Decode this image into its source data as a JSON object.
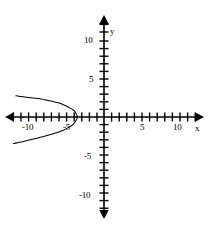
{
  "figure": {
    "name": "cartesian-plane-with-leftward-parabola",
    "background_color": "#ffffff",
    "stroke_color": "#000000"
  },
  "axes": {
    "x_axis_label": "x",
    "y_axis_label": "y",
    "x_tick_labels": [
      "-10",
      "-5",
      "5",
      "10"
    ],
    "y_tick_labels": [
      "10",
      "5",
      "-5",
      "-10"
    ],
    "labels": {
      "x_neg10": "-10",
      "x_neg5": "-5",
      "x_5": "5",
      "x_10": "10",
      "y_10": "10",
      "y_5": "5",
      "y_neg5": "-5",
      "y_neg10": "-10"
    }
  },
  "chart_data": {
    "type": "line",
    "title": "",
    "xlabel": "x",
    "ylabel": "y",
    "xlim": [
      -12.7,
      12.7
    ],
    "ylim": [
      -13.8,
      13.8
    ],
    "grid": false,
    "legend": null,
    "x_ticks": [
      -12,
      -11,
      -10,
      -9,
      -8,
      -7,
      -6,
      -5,
      -4,
      -3,
      -2,
      -1,
      1,
      2,
      3,
      4,
      5,
      6,
      7,
      8,
      9,
      10,
      11,
      12
    ],
    "y_ticks": [
      -13,
      -12,
      -11,
      -10,
      -9,
      -8,
      -7,
      -6,
      -5,
      -4,
      -3,
      -2,
      -1,
      1,
      2,
      3,
      4,
      5,
      6,
      7,
      8,
      9,
      10,
      11,
      12,
      13
    ],
    "x_labeled_ticks": [
      -10,
      -5,
      5,
      10
    ],
    "y_labeled_ticks": [
      -10,
      -5,
      5,
      10
    ],
    "series": [
      {
        "name": "leftward-opening-parabola",
        "vertex": [
          -3.5,
          0
        ],
        "opens": "left",
        "series_points": [
          [
            -11.6,
            2.8
          ],
          [
            -11.0,
            2.7
          ],
          [
            -10.2,
            2.6
          ],
          [
            -9.3,
            2.5
          ],
          [
            -8.4,
            2.4
          ],
          [
            -7.5,
            2.2
          ],
          [
            -6.6,
            2.0
          ],
          [
            -5.8,
            1.8
          ],
          [
            -5.1,
            1.5
          ],
          [
            -4.5,
            1.2
          ],
          [
            -4.0,
            0.9
          ],
          [
            -3.7,
            0.5
          ],
          [
            -3.5,
            0.0
          ],
          [
            -3.7,
            -0.5
          ],
          [
            -4.1,
            -1.0
          ],
          [
            -4.7,
            -1.4
          ],
          [
            -5.5,
            -1.8
          ],
          [
            -6.4,
            -2.1
          ],
          [
            -7.4,
            -2.4
          ],
          [
            -8.5,
            -2.7
          ],
          [
            -9.7,
            -3.0
          ],
          [
            -10.9,
            -3.3
          ],
          [
            -11.9,
            -3.5
          ]
        ]
      }
    ]
  }
}
